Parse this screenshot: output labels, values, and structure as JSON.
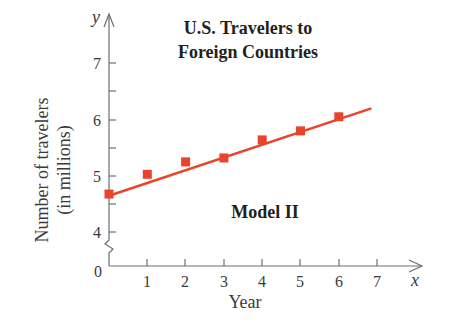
{
  "chart_data": {
    "type": "scatter",
    "title": "U.S. Travelers to Foreign Countries",
    "title_lines": [
      "U.S. Travelers to",
      "Foreign Countries"
    ],
    "annotation": "Model II",
    "xlabel": "Year",
    "ylabel": "Number of travelers (in millions)",
    "ylabel_lines": [
      "Number of travelers",
      "(in millions)"
    ],
    "x_axis_var": "x",
    "y_axis_var": "y",
    "xlim": [
      0,
      7.5
    ],
    "ylim": [
      4,
      7.5
    ],
    "y_axis_break": true,
    "origin_label": "0",
    "x_ticks": [
      1,
      2,
      3,
      4,
      5,
      6,
      7
    ],
    "x_tick_labels": [
      "1",
      "2",
      "3",
      "4",
      "5",
      "6",
      "7"
    ],
    "y_ticks": [
      4,
      5,
      6,
      7
    ],
    "y_tick_labels": [
      "4",
      "5",
      "6",
      "7"
    ],
    "y_minor_ticks": [
      4.5,
      5.5,
      6.5
    ],
    "grid": false,
    "legend": null,
    "series": [
      {
        "name": "Data points",
        "marker": "square",
        "color": "#e8442c",
        "x": [
          0,
          1,
          2,
          3,
          4,
          5,
          6
        ],
        "y": [
          4.68,
          5.03,
          5.25,
          5.32,
          5.64,
          5.8,
          6.05
        ]
      },
      {
        "name": "Model II (linear fit)",
        "type": "line",
        "color": "#e8442c",
        "x": [
          0,
          6.85
        ],
        "y": [
          4.65,
          6.2
        ]
      }
    ]
  }
}
